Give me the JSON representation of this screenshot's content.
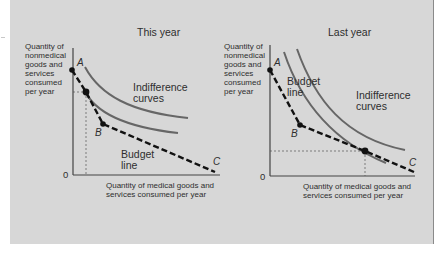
{
  "figure": {
    "panels": [
      {
        "title": "This year",
        "y_axis_label": [
          "Quantity of",
          "nonmedical",
          "goods and",
          "services",
          "consumed",
          "per year"
        ],
        "x_axis_label": [
          "Quantity of medical goods and",
          "services consumed per year"
        ],
        "origin_label": "0",
        "curve_label": [
          "Indifference",
          "curves"
        ],
        "budget_label": [
          "Budget",
          "line"
        ],
        "points": {
          "a": "A",
          "b": "B",
          "c": "C"
        }
      },
      {
        "title": "Last  year",
        "y_axis_label": [
          "Quantity of",
          "nonmedical",
          "goods and",
          "services",
          "consumed",
          "per year"
        ],
        "x_axis_label": [
          "Quantity of medical goods and",
          "services consumed per year"
        ],
        "origin_label": "0",
        "curve_label": [
          "Indifference",
          "curves"
        ],
        "budget_label": [
          "Budget",
          "line"
        ],
        "points": {
          "a": "A",
          "b": "B",
          "c": "C"
        }
      }
    ],
    "colors": {
      "background": "#d7d7d7",
      "text": "#2e2e2e",
      "curve": "#666666",
      "budget_line": "#111111"
    }
  }
}
